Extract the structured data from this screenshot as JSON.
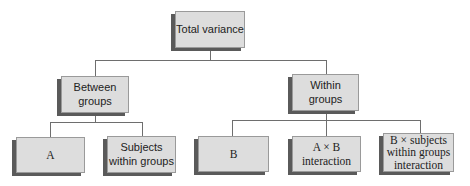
{
  "diagram": {
    "type": "tree",
    "root": {
      "label": "Total variance"
    },
    "level1": [
      {
        "label": "Between\ngroups"
      },
      {
        "label": "Within\ngroups"
      }
    ],
    "level2": [
      {
        "label": "A",
        "parent": "Between groups"
      },
      {
        "label": "Subjects\nwithin groups",
        "parent": "Between groups"
      },
      {
        "label": "B",
        "parent": "Within groups"
      },
      {
        "label": "A × B\ninteraction",
        "parent": "Within groups"
      },
      {
        "label": "B × subjects\nwithin groups\ninteraction",
        "parent": "Within groups"
      }
    ],
    "colors": {
      "box_fill": "#dddddd",
      "box_border": "#9a9a9a",
      "box_shadow": "#5a5a5a",
      "connector": "#6e6e6e",
      "text": "#222222"
    }
  }
}
